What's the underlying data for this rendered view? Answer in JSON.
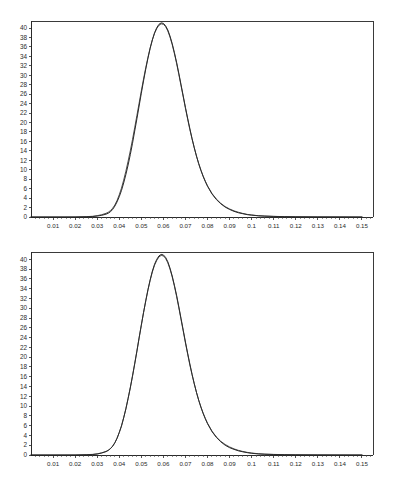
{
  "page": {
    "background_color": "#ffffff",
    "axis_color": "#2a2a2a",
    "curve_color": "#111111",
    "curve_color_secondary": "#2d2d2d"
  },
  "chart_data": [
    {
      "id": "top",
      "type": "line",
      "title": "",
      "subtitle": "",
      "xlabel": "",
      "ylabel": "",
      "xlim": [
        0.0,
        0.155
      ],
      "ylim": [
        0,
        41.5
      ],
      "grid": false,
      "legend": "none",
      "xticks": [
        0.01,
        0.02,
        0.03,
        0.04,
        0.05,
        0.06,
        0.07,
        0.08,
        0.09,
        0.1,
        0.11,
        0.12,
        0.13,
        0.14,
        0.15
      ],
      "xtick_labels": [
        "0.01",
        "0.02",
        "0.03",
        "0.04",
        "0.05",
        "0.06",
        "0.07",
        "0.08",
        "0.09",
        "0.1",
        "0.11",
        "0.12",
        "0.13",
        "0.14",
        "0.15"
      ],
      "yticks": [
        0,
        2,
        4,
        6,
        8,
        10,
        12,
        14,
        16,
        18,
        20,
        22,
        24,
        26,
        28,
        30,
        32,
        34,
        36,
        38,
        40
      ],
      "ytick_labels": [
        "0",
        "2",
        "4",
        "6",
        "8",
        "10",
        "12",
        "14",
        "16",
        "18",
        "20",
        "22",
        "24",
        "26",
        "28",
        "30",
        "32",
        "34",
        "36",
        "38",
        "40"
      ],
      "x": [
        0.0,
        0.005,
        0.01,
        0.015,
        0.02,
        0.025,
        0.028,
        0.03,
        0.032,
        0.034,
        0.035,
        0.036,
        0.037,
        0.038,
        0.039,
        0.04,
        0.041,
        0.042,
        0.043,
        0.044,
        0.045,
        0.046,
        0.047,
        0.048,
        0.049,
        0.05,
        0.051,
        0.052,
        0.053,
        0.054,
        0.055,
        0.056,
        0.057,
        0.058,
        0.059,
        0.06,
        0.061,
        0.062,
        0.063,
        0.064,
        0.065,
        0.066,
        0.067,
        0.068,
        0.069,
        0.07,
        0.071,
        0.072,
        0.073,
        0.074,
        0.075,
        0.076,
        0.077,
        0.078,
        0.079,
        0.08,
        0.082,
        0.084,
        0.086,
        0.088,
        0.09,
        0.092,
        0.094,
        0.096,
        0.098,
        0.1,
        0.103,
        0.106,
        0.11,
        0.115,
        0.12,
        0.13,
        0.14,
        0.15
      ],
      "series": [
        {
          "name": "empirical",
          "values": [
            0.0,
            0.0,
            0.0,
            0.0,
            0.0,
            0.05,
            0.1,
            0.2,
            0.35,
            0.6,
            0.8,
            1.1,
            1.6,
            2.3,
            3.2,
            4.3,
            5.6,
            7.2,
            9.0,
            11.0,
            13.2,
            15.6,
            18.2,
            20.8,
            23.5,
            26.2,
            28.8,
            31.3,
            33.6,
            35.7,
            37.5,
            39.0,
            40.1,
            40.8,
            41.1,
            41.0,
            40.5,
            39.6,
            38.3,
            36.7,
            34.8,
            32.7,
            30.4,
            28.0,
            25.6,
            23.2,
            20.9,
            18.7,
            16.6,
            14.7,
            12.9,
            11.3,
            9.9,
            8.6,
            7.5,
            6.5,
            4.9,
            3.7,
            2.8,
            2.1,
            1.6,
            1.2,
            0.9,
            0.7,
            0.5,
            0.4,
            0.25,
            0.18,
            0.12,
            0.07,
            0.04,
            0.02,
            0.01,
            0.0
          ]
        },
        {
          "name": "fitted",
          "values": [
            0.0,
            0.0,
            0.0,
            0.0,
            0.01,
            0.07,
            0.15,
            0.28,
            0.48,
            0.78,
            1.0,
            1.35,
            1.85,
            2.55,
            3.5,
            4.7,
            6.1,
            7.8,
            9.7,
            11.8,
            14.0,
            16.4,
            18.9,
            21.5,
            24.1,
            26.7,
            29.2,
            31.6,
            33.8,
            35.8,
            37.5,
            38.9,
            39.9,
            40.6,
            40.9,
            40.8,
            40.3,
            39.4,
            38.1,
            36.5,
            34.6,
            32.5,
            30.2,
            27.8,
            25.4,
            23.0,
            20.7,
            18.5,
            16.5,
            14.6,
            12.9,
            11.3,
            9.9,
            8.7,
            7.6,
            6.6,
            5.0,
            3.8,
            2.9,
            2.2,
            1.7,
            1.3,
            1.0,
            0.75,
            0.55,
            0.42,
            0.28,
            0.2,
            0.13,
            0.08,
            0.045,
            0.02,
            0.01,
            0.0
          ]
        }
      ]
    },
    {
      "id": "bottom",
      "type": "line",
      "title": "",
      "subtitle": "",
      "xlabel": "",
      "ylabel": "",
      "xlim": [
        0.0,
        0.155
      ],
      "ylim": [
        0,
        41.5
      ],
      "grid": false,
      "legend": "none",
      "xticks": [
        0.01,
        0.02,
        0.03,
        0.04,
        0.05,
        0.06,
        0.07,
        0.08,
        0.09,
        0.1,
        0.11,
        0.12,
        0.13,
        0.14,
        0.15
      ],
      "xtick_labels": [
        "0.01",
        "0.02",
        "0.03",
        "0.04",
        "0.05",
        "0.06",
        "0.07",
        "0.08",
        "0.09",
        "0.1",
        "0.11",
        "0.12",
        "0.13",
        "0.14",
        "0.15"
      ],
      "yticks": [
        0,
        2,
        4,
        6,
        8,
        10,
        12,
        14,
        16,
        18,
        20,
        22,
        24,
        26,
        28,
        30,
        32,
        34,
        36,
        38,
        40
      ],
      "ytick_labels": [
        "0",
        "2",
        "4",
        "6",
        "8",
        "10",
        "12",
        "14",
        "16",
        "18",
        "20",
        "22",
        "24",
        "26",
        "28",
        "30",
        "32",
        "34",
        "36",
        "38",
        "40"
      ],
      "x": [
        0.0,
        0.005,
        0.01,
        0.015,
        0.02,
        0.025,
        0.028,
        0.03,
        0.032,
        0.034,
        0.035,
        0.036,
        0.037,
        0.038,
        0.039,
        0.04,
        0.041,
        0.042,
        0.043,
        0.044,
        0.045,
        0.046,
        0.047,
        0.048,
        0.049,
        0.05,
        0.051,
        0.052,
        0.053,
        0.054,
        0.055,
        0.056,
        0.057,
        0.058,
        0.059,
        0.06,
        0.061,
        0.062,
        0.063,
        0.064,
        0.065,
        0.066,
        0.067,
        0.068,
        0.069,
        0.07,
        0.071,
        0.072,
        0.073,
        0.074,
        0.075,
        0.076,
        0.077,
        0.078,
        0.079,
        0.08,
        0.082,
        0.084,
        0.086,
        0.088,
        0.09,
        0.092,
        0.094,
        0.096,
        0.098,
        0.1,
        0.103,
        0.106,
        0.11,
        0.115,
        0.12,
        0.13,
        0.14,
        0.15
      ],
      "series": [
        {
          "name": "empirical",
          "values": [
            0.0,
            0.0,
            0.0,
            0.0,
            0.0,
            0.05,
            0.1,
            0.2,
            0.4,
            0.7,
            0.95,
            1.3,
            1.8,
            2.5,
            3.4,
            4.6,
            5.9,
            7.6,
            9.4,
            11.5,
            13.7,
            16.1,
            18.6,
            21.2,
            23.9,
            26.5,
            29.1,
            31.5,
            33.8,
            35.8,
            37.6,
            39.0,
            40.0,
            40.7,
            41.0,
            40.9,
            40.4,
            39.5,
            38.2,
            36.6,
            34.7,
            32.6,
            30.3,
            27.9,
            25.5,
            23.1,
            20.8,
            18.6,
            16.5,
            14.6,
            12.8,
            11.2,
            9.8,
            8.5,
            7.4,
            6.4,
            4.8,
            3.6,
            2.7,
            2.0,
            1.5,
            1.15,
            0.85,
            0.65,
            0.48,
            0.35,
            0.22,
            0.15,
            0.1,
            0.06,
            0.035,
            0.015,
            0.005,
            0.0
          ]
        },
        {
          "name": "fitted",
          "values": [
            0.0,
            0.0,
            0.0,
            0.0,
            0.005,
            0.06,
            0.13,
            0.24,
            0.44,
            0.72,
            0.95,
            1.3,
            1.8,
            2.5,
            3.45,
            4.6,
            5.95,
            7.6,
            9.5,
            11.6,
            13.8,
            16.2,
            18.7,
            21.3,
            24.0,
            26.6,
            29.1,
            31.5,
            33.7,
            35.7,
            37.4,
            38.8,
            39.8,
            40.5,
            40.8,
            40.7,
            40.2,
            39.3,
            38.0,
            36.4,
            34.5,
            32.4,
            30.1,
            27.7,
            25.3,
            22.9,
            20.6,
            18.4,
            16.4,
            14.5,
            12.8,
            11.2,
            9.8,
            8.6,
            7.5,
            6.5,
            4.9,
            3.7,
            2.8,
            2.15,
            1.65,
            1.25,
            0.95,
            0.72,
            0.54,
            0.4,
            0.26,
            0.18,
            0.12,
            0.07,
            0.04,
            0.018,
            0.006,
            0.0
          ]
        }
      ]
    }
  ]
}
